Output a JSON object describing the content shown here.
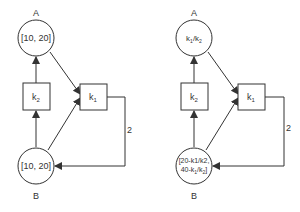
{
  "diagrams": [
    {
      "name": "left",
      "nodeA": {
        "label": "A",
        "value": "[10, 20]"
      },
      "nodeB": {
        "label": "B",
        "value": "[10, 20]"
      },
      "k2": {
        "label": "k",
        "sub": "2"
      },
      "k1": {
        "label": "k",
        "sub": "1"
      },
      "edge_label": "2"
    },
    {
      "name": "right",
      "nodeA": {
        "label": "A",
        "value": "k1/k2"
      },
      "nodeB": {
        "label": "B",
        "line1": "[20-k1/k2,",
        "line2": "40-k1/k2]"
      },
      "k2": {
        "label": "k",
        "sub": "2"
      },
      "k1": {
        "label": "k",
        "sub": "1"
      },
      "edge_label": "2"
    }
  ]
}
